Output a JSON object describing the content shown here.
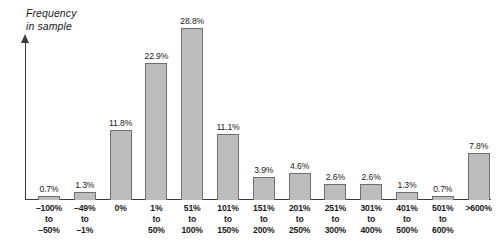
{
  "chart_data": {
    "type": "bar",
    "title": "",
    "subtitle": "",
    "xlabel": "",
    "ylabel": "Frequency\nin sample",
    "ylim": [
      0,
      30
    ],
    "grid": false,
    "legend": null,
    "value_label_suffix": "%",
    "categories": [
      "–100%\nto\n–50%",
      "–49%\nto\n–1%",
      "0%",
      "1%\nto\n50%",
      "51%\nto\n100%",
      "101%\nto\n150%",
      "151%\nto\n200%",
      "201%\nto\n250%",
      "251%\nto\n300%",
      "301%\nto\n400%",
      "401%\nto\n500%",
      "501%\nto\n600%",
      ">600%"
    ],
    "values": [
      0.7,
      1.3,
      11.8,
      22.9,
      28.8,
      11.1,
      3.9,
      4.6,
      2.6,
      2.6,
      1.3,
      0.7,
      7.8
    ],
    "value_labels": [
      "0.7%",
      "1.3%",
      "11.8%",
      "22.9%",
      "28.8%",
      "11.1%",
      "3.9%",
      "4.6%",
      "2.6%",
      "2.6%",
      "1.3%",
      "0.7%",
      "7.8%"
    ],
    "colors": {
      "bar_fill": "#bdbdbd",
      "bar_border": "#6e6e6e",
      "axis": "#3b3b3b",
      "text": "#1a1a1a",
      "background": "#ffffff"
    }
  }
}
